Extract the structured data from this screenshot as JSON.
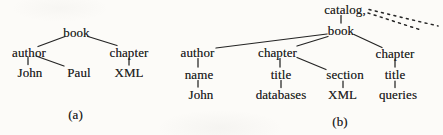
{
  "colors": {
    "ink": "#242424",
    "paper": "#fcfbf8"
  },
  "figure": {
    "caption_a": "(a)",
    "caption_b": "(b)"
  },
  "tree_a": {
    "nodes": {
      "book": "book",
      "author": "author",
      "chapter": "chapter",
      "john": "John",
      "paul": "Paul",
      "xml": "XML"
    }
  },
  "tree_b": {
    "nodes": {
      "catalog": "catalog,",
      "book": "book",
      "author": "author",
      "chapter_1": "chapter",
      "chapter_2": "chapter",
      "name": "name",
      "title_1": "title",
      "section": "section",
      "title_2": "title",
      "john": "John",
      "databases": "databases",
      "xml": "XML",
      "queries": "queries"
    }
  }
}
